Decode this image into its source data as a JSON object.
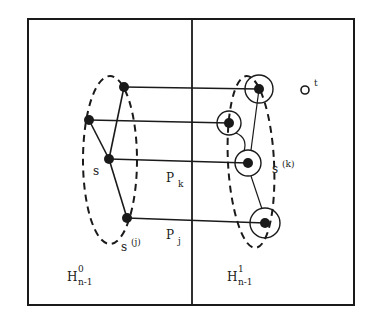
{
  "diagram": {
    "colors": {
      "ink": "#1a1a1a",
      "background": "#ffffff"
    },
    "frame": {
      "x": 28,
      "y": 19,
      "width": 326,
      "height": 286,
      "divider_x": 192
    },
    "left_partition": {
      "label_main": "H",
      "label_sup": "0",
      "label_sub": "n-1"
    },
    "right_partition": {
      "label_main": "H",
      "label_sup": "1",
      "label_sub": "n-1"
    },
    "left_nodes": [
      {
        "id": "l1",
        "x": 124,
        "y": 87
      },
      {
        "id": "l2",
        "x": 89,
        "y": 120
      },
      {
        "id": "s",
        "x": 109,
        "y": 159,
        "label": "s"
      },
      {
        "id": "sj",
        "x": 127,
        "y": 218
      }
    ],
    "right_nodes": [
      {
        "id": "r1",
        "x": 259,
        "y": 89,
        "ring": 14
      },
      {
        "id": "r2",
        "x": 229,
        "y": 123,
        "ring": 12
      },
      {
        "id": "r3",
        "x": 248,
        "y": 163,
        "ring": 13
      },
      {
        "id": "r4",
        "x": 265,
        "y": 223,
        "ring": 15
      }
    ],
    "target_node": {
      "x": 305,
      "y": 90,
      "label": "t"
    },
    "labels": {
      "s": "s",
      "s_j_main": "s",
      "s_j_sup": "(j)",
      "s_k_main": "s",
      "s_k_sup": "(k)",
      "t": "t",
      "p_k_main": "P",
      "p_k_sub": "k",
      "p_j_main": "P",
      "p_j_sub": "j"
    }
  }
}
